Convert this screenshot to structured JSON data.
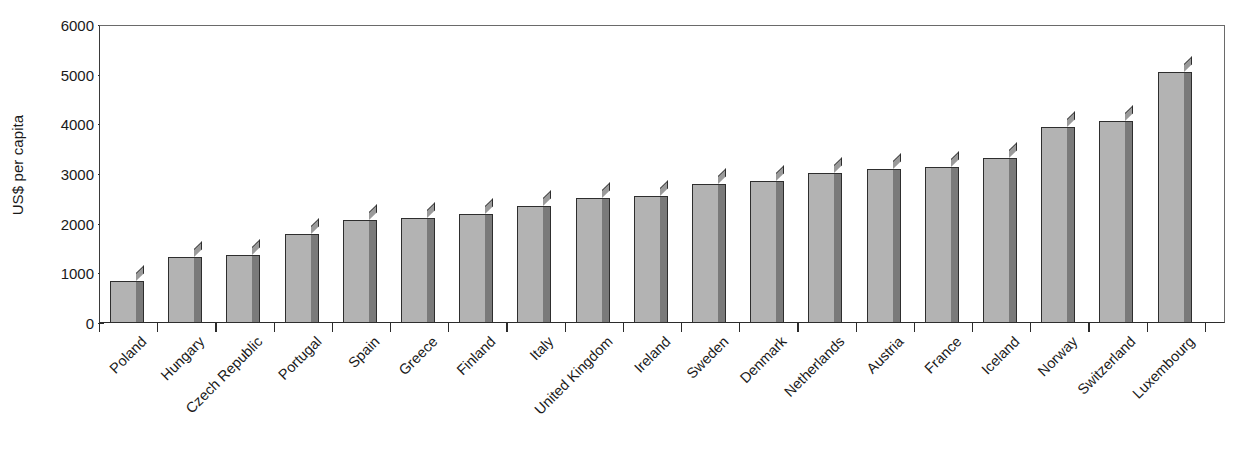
{
  "chart_data": {
    "type": "bar",
    "title": "",
    "subtitle": "",
    "xlabel": "",
    "ylabel": "US$ per capita",
    "ylim": [
      0,
      6000
    ],
    "ytick_values": [
      0,
      1000,
      2000,
      3000,
      4000,
      5000,
      6000
    ],
    "ytick_labels": [
      "0",
      "1000",
      "2000",
      "3000",
      "4000",
      "5000",
      "6000"
    ],
    "grid": false,
    "legend": null,
    "legend_position": "none",
    "annotations": [],
    "bar_style": "3d-shaded",
    "colors": {
      "bar_face": "#b3b3b3",
      "bar_side": "#7a7a7a",
      "bar_top": "#9a9a9a",
      "bar_outline": "#2e2e2e",
      "axis": "#2b2b2b",
      "text": "#1a1a1a",
      "background": "#ffffff"
    },
    "categories": [
      "Poland",
      "Hungary",
      "Czech Republic",
      "Portugal",
      "Spain",
      "Greece",
      "Finland",
      "Italy",
      "United Kingdom",
      "Ireland",
      "Sweden",
      "Denmark",
      "Netherlands",
      "Austria",
      "France",
      "Iceland",
      "Norway",
      "Switzerland",
      "Luxembourg"
    ],
    "values": [
      850,
      1320,
      1360,
      1800,
      2080,
      2120,
      2200,
      2360,
      2510,
      2560,
      2790,
      2860,
      3020,
      3100,
      3150,
      3320,
      3950,
      4060,
      5060
    ]
  }
}
